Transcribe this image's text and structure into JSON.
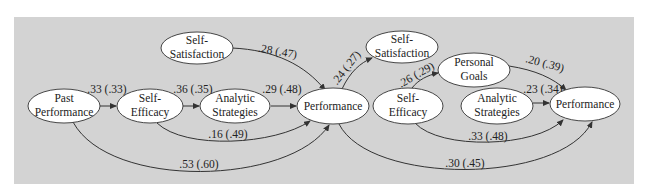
{
  "diagram": {
    "panels": [
      {
        "name": "left-model",
        "nodes": [
          {
            "id": "past_performance",
            "lines": [
              "Past",
              "Performance"
            ]
          },
          {
            "id": "self_efficacy_1",
            "lines": [
              "Self-",
              "Efficacy"
            ]
          },
          {
            "id": "analytic_strategies_1",
            "lines": [
              "Analytic",
              "Strategies"
            ]
          },
          {
            "id": "self_satisfaction_1",
            "lines": [
              "Self-",
              "Satisfaction"
            ]
          },
          {
            "id": "performance_1",
            "lines": [
              "Performance"
            ]
          }
        ],
        "edges": [
          {
            "from": "past_performance",
            "to": "self_efficacy_1",
            "label": ".33 (.33)"
          },
          {
            "from": "self_efficacy_1",
            "to": "analytic_strategies_1",
            "label": ".36 (.35)"
          },
          {
            "from": "analytic_strategies_1",
            "to": "performance_1",
            "label": ".29 (.48)"
          },
          {
            "from": "self_satisfaction_1",
            "to": "performance_1",
            "label": ".28 (.47)"
          },
          {
            "from": "self_efficacy_1",
            "to": "performance_1",
            "label": ".16 (.49)"
          },
          {
            "from": "past_performance",
            "to": "performance_1",
            "label": ".53 (.60)"
          }
        ]
      },
      {
        "name": "right-model",
        "nodes": [
          {
            "id": "self_satisfaction_2",
            "lines": [
              "Self-",
              "Satisfaction"
            ]
          },
          {
            "id": "personal_goals",
            "lines": [
              "Personal",
              "Goals"
            ]
          },
          {
            "id": "self_efficacy_2",
            "lines": [
              "Self-",
              "Efficacy"
            ]
          },
          {
            "id": "analytic_strategies_2",
            "lines": [
              "Analytic",
              "Strategies"
            ]
          },
          {
            "id": "performance_2",
            "lines": [
              "Performance"
            ]
          }
        ],
        "edges": [
          {
            "from": "performance_1",
            "to": "self_satisfaction_2",
            "label": ".24 (.27)"
          },
          {
            "from": "self_efficacy_2",
            "to": "personal_goals",
            "label": ".26 (.29)"
          },
          {
            "from": "personal_goals",
            "to": "performance_2",
            "label": ".20 (.39)"
          },
          {
            "from": "analytic_strategies_2",
            "to": "performance_2",
            "label": ".23 (.34)"
          },
          {
            "from": "self_efficacy_2",
            "to": "performance_2",
            "label": ".33 (.48)"
          },
          {
            "from": "performance_1",
            "to": "performance_2",
            "label": ".30 (.45)"
          }
        ]
      }
    ],
    "colors": {
      "background": "#d3d3d3",
      "node_fill": "#ffffff",
      "stroke": "#333333",
      "text": "#222222"
    }
  }
}
